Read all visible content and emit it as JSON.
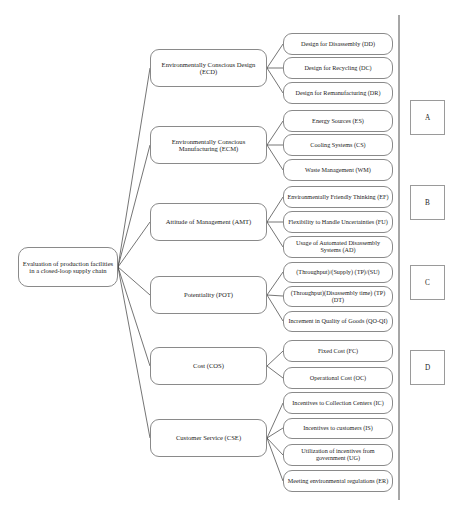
{
  "diagram": {
    "title_node": {
      "id": "root",
      "label": "Evaluation of production facilities in a closed-loop supply chain"
    },
    "branches": [
      {
        "id": "ECD",
        "label": "Environmentally Conscious Design (ECD)",
        "leaves": [
          {
            "id": "DD",
            "label": "Design for Disassembly (DD)"
          },
          {
            "id": "DC",
            "label": "Design for Recycling (DC)"
          },
          {
            "id": "DR",
            "label": "Design for Remanufacturing (DR)"
          }
        ]
      },
      {
        "id": "ECM",
        "label": "Environmentally Conscious Manufacturing (ECM)",
        "leaves": [
          {
            "id": "ES",
            "label": "Energy Sources (ES)"
          },
          {
            "id": "CS",
            "label": "Cooling Systems (CS)"
          },
          {
            "id": "WM",
            "label": "Waste Management (WM)"
          }
        ]
      },
      {
        "id": "AMT",
        "label": "Attitude of Management (AMT)",
        "leaves": [
          {
            "id": "EF",
            "label": "Environmentally Friendly Thinking (EF)"
          },
          {
            "id": "FU",
            "label": "Flexibility to Handle Uncertainties (FU)"
          },
          {
            "id": "AD",
            "label": "Usage of Automated Disassembly Systems (AD)"
          }
        ]
      },
      {
        "id": "POT",
        "label": "Potentiality (POT)",
        "leaves": [
          {
            "id": "TPSU",
            "label": "(Throughput)/(Supply) (TP)/(SU)"
          },
          {
            "id": "TPDT",
            "label": "(Throughput)(Disassembly time) (TP)(DT)"
          },
          {
            "id": "QOQI",
            "label": "Increment in Quality of Goods (QO-QI)"
          }
        ]
      },
      {
        "id": "COS",
        "label": "Cost (COS)",
        "leaves": [
          {
            "id": "FC",
            "label": "Fixed Cost (FC)"
          },
          {
            "id": "OC",
            "label": "Operational Cost (OC)"
          }
        ]
      },
      {
        "id": "CSE",
        "label": "Customer Service (CSE)",
        "leaves": [
          {
            "id": "IC",
            "label": "Incentives to Collection Centers (IC)"
          },
          {
            "id": "IS",
            "label": "Incentives to customers (IS)"
          },
          {
            "id": "UG",
            "label": "Utilization of incentives from government (UG)"
          },
          {
            "id": "ER",
            "label": "Meeting environmental regulations (ER)"
          }
        ]
      }
    ],
    "alternatives": [
      {
        "id": "A",
        "label": "A"
      },
      {
        "id": "B",
        "label": "B"
      },
      {
        "id": "C",
        "label": "C"
      },
      {
        "id": "D",
        "label": "D"
      }
    ]
  },
  "colors": {
    "node_border": "#8a8a8a",
    "line": "#3a3a3a",
    "text": "#1b1b1b",
    "background": "#ffffff"
  }
}
